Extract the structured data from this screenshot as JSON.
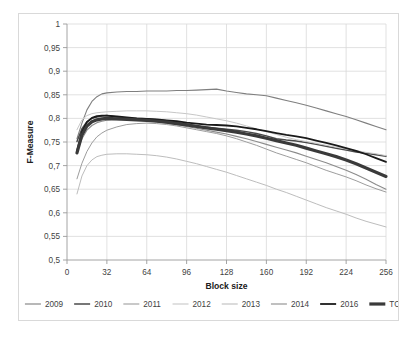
{
  "chart_data": {
    "type": "line",
    "title": "",
    "xlabel": "Block size",
    "ylabel": "F-Measure",
    "xlim": [
      0,
      256
    ],
    "ylim": [
      0.5,
      1.0
    ],
    "xticks": [
      "0",
      "32",
      "64",
      "96",
      "128",
      "160",
      "192",
      "224",
      "256"
    ],
    "xtick_values": [
      0,
      32,
      64,
      96,
      128,
      160,
      192,
      224,
      256
    ],
    "yticks": [
      "0,5",
      "0,55",
      "0,6",
      "0,65",
      "0,7",
      "0,75",
      "0,8",
      "0,85",
      "0,9",
      "0,95",
      "1"
    ],
    "ytick_values": [
      0.5,
      0.55,
      0.6,
      0.65,
      0.7,
      0.75,
      0.8,
      0.85,
      0.9,
      0.95,
      1.0
    ],
    "grid": true,
    "legend_position": "bottom",
    "decimal_separator": ",",
    "x": [
      8,
      12,
      16,
      20,
      24,
      28,
      32,
      40,
      48,
      56,
      64,
      72,
      80,
      88,
      96,
      104,
      112,
      120,
      128,
      136,
      144,
      152,
      160,
      168,
      176,
      184,
      192,
      200,
      208,
      216,
      224,
      232,
      240,
      248,
      256
    ],
    "series": [
      {
        "name": "2009",
        "color": "#7f7f7f",
        "width": 1.1,
        "values": [
          0.757,
          0.79,
          0.818,
          0.836,
          0.846,
          0.852,
          0.854,
          0.856,
          0.857,
          0.857,
          0.858,
          0.858,
          0.858,
          0.859,
          0.859,
          0.86,
          0.861,
          0.862,
          0.858,
          0.855,
          0.852,
          0.85,
          0.848,
          0.843,
          0.838,
          0.833,
          0.828,
          0.822,
          0.816,
          0.81,
          0.804,
          0.797,
          0.79,
          0.783,
          0.776
        ]
      },
      {
        "name": "2010",
        "color": "#4a4a4a",
        "width": 1.5,
        "values": [
          0.751,
          0.778,
          0.793,
          0.8,
          0.803,
          0.805,
          0.806,
          0.803,
          0.801,
          0.8,
          0.799,
          0.797,
          0.795,
          0.792,
          0.788,
          0.784,
          0.781,
          0.779,
          0.777,
          0.775,
          0.772,
          0.768,
          0.763,
          0.757,
          0.754,
          0.752,
          0.749,
          0.745,
          0.741,
          0.737,
          0.733,
          0.729,
          0.726,
          0.723,
          0.72
        ]
      },
      {
        "name": "2011",
        "color": "#9d9d9d",
        "width": 1.0,
        "values": [
          0.672,
          0.705,
          0.73,
          0.748,
          0.761,
          0.769,
          0.775,
          0.782,
          0.787,
          0.789,
          0.79,
          0.789,
          0.787,
          0.784,
          0.78,
          0.776,
          0.772,
          0.768,
          0.763,
          0.757,
          0.75,
          0.743,
          0.735,
          0.727,
          0.72,
          0.713,
          0.706,
          0.698,
          0.69,
          0.683,
          0.676,
          0.668,
          0.659,
          0.651,
          0.644
        ]
      },
      {
        "name": "2012",
        "color": "#c7c7c7",
        "width": 1.0,
        "values": [
          0.776,
          0.797,
          0.806,
          0.81,
          0.812,
          0.813,
          0.814,
          0.815,
          0.816,
          0.816,
          0.816,
          0.815,
          0.814,
          0.812,
          0.81,
          0.807,
          0.803,
          0.799,
          0.795,
          0.79,
          0.784,
          0.778,
          0.772,
          0.766,
          0.76,
          0.755,
          0.751,
          0.747,
          0.743,
          0.739,
          0.735,
          0.732,
          0.728,
          0.725,
          0.721
        ]
      },
      {
        "name": "2013",
        "color": "#bdbdbd",
        "width": 1.0,
        "values": [
          0.64,
          0.678,
          0.7,
          0.712,
          0.719,
          0.722,
          0.724,
          0.725,
          0.725,
          0.724,
          0.723,
          0.721,
          0.718,
          0.714,
          0.709,
          0.704,
          0.698,
          0.692,
          0.686,
          0.679,
          0.672,
          0.665,
          0.658,
          0.65,
          0.643,
          0.635,
          0.627,
          0.619,
          0.611,
          0.604,
          0.597,
          0.589,
          0.582,
          0.576,
          0.57
        ]
      },
      {
        "name": "2014",
        "color": "#8c8c8c",
        "width": 1.1,
        "values": [
          0.728,
          0.757,
          0.775,
          0.785,
          0.791,
          0.794,
          0.796,
          0.797,
          0.797,
          0.796,
          0.795,
          0.793,
          0.79,
          0.787,
          0.783,
          0.779,
          0.775,
          0.771,
          0.767,
          0.762,
          0.757,
          0.751,
          0.745,
          0.739,
          0.733,
          0.727,
          0.72,
          0.713,
          0.706,
          0.698,
          0.69,
          0.681,
          0.671,
          0.66,
          0.65
        ]
      },
      {
        "name": "2016",
        "color": "#1a1a1a",
        "width": 1.8,
        "values": [
          0.731,
          0.772,
          0.792,
          0.801,
          0.805,
          0.806,
          0.806,
          0.804,
          0.802,
          0.8,
          0.799,
          0.798,
          0.796,
          0.794,
          0.791,
          0.789,
          0.787,
          0.786,
          0.785,
          0.783,
          0.78,
          0.777,
          0.773,
          0.769,
          0.765,
          0.762,
          0.758,
          0.753,
          0.748,
          0.743,
          0.737,
          0.731,
          0.724,
          0.716,
          0.708
        ]
      },
      {
        "name": "TOTAL",
        "color": "#3a3a3a",
        "width": 3.2,
        "values": [
          0.727,
          0.765,
          0.784,
          0.793,
          0.797,
          0.799,
          0.8,
          0.799,
          0.798,
          0.797,
          0.796,
          0.794,
          0.792,
          0.789,
          0.786,
          0.783,
          0.78,
          0.777,
          0.774,
          0.771,
          0.767,
          0.763,
          0.758,
          0.753,
          0.748,
          0.743,
          0.737,
          0.731,
          0.725,
          0.719,
          0.712,
          0.704,
          0.695,
          0.686,
          0.677
        ]
      }
    ]
  }
}
